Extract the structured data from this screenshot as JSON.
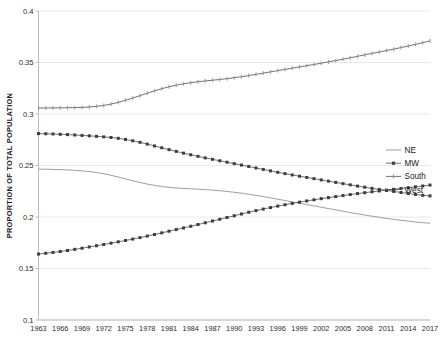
{
  "chart_data": {
    "type": "line",
    "title": "",
    "xlabel": "",
    "ylabel": "PROPORTION OF TOTAL POPULATION",
    "ylim": [
      0.1,
      0.4
    ],
    "yticks": [
      "0.1",
      "0.15",
      "0.2",
      "0.25",
      "0.3",
      "0.35",
      "0.4"
    ],
    "ytick_values": [
      0.1,
      0.15,
      0.2,
      0.25,
      0.3,
      0.35,
      0.4
    ],
    "grid": true,
    "legend_position": "right-middle",
    "xlim": [
      1963,
      2017
    ],
    "xtick_labels": [
      "1963",
      "1966",
      "1969",
      "1972",
      "1975",
      "1978",
      "1981",
      "1984",
      "1987",
      "1990",
      "1993",
      "1996",
      "1999",
      "2002",
      "2005",
      "2008",
      "2011",
      "2014",
      "2017"
    ],
    "x": [
      1963,
      1964,
      1965,
      1966,
      1967,
      1968,
      1969,
      1970,
      1971,
      1972,
      1973,
      1974,
      1975,
      1976,
      1977,
      1978,
      1979,
      1980,
      1981,
      1982,
      1983,
      1984,
      1985,
      1986,
      1987,
      1988,
      1989,
      1990,
      1991,
      1992,
      1993,
      1994,
      1995,
      1996,
      1997,
      1998,
      1999,
      2000,
      2001,
      2002,
      2003,
      2004,
      2005,
      2006,
      2007,
      2008,
      2009,
      2010,
      2011,
      2012,
      2013,
      2014,
      2015,
      2016,
      2017
    ],
    "series": [
      {
        "name": "NE",
        "marker": "none",
        "values": [
          0.2465,
          0.2464,
          0.2462,
          0.246,
          0.2457,
          0.2453,
          0.2448,
          0.2441,
          0.2432,
          0.242,
          0.2405,
          0.2388,
          0.237,
          0.2352,
          0.2335,
          0.232,
          0.2307,
          0.2296,
          0.2288,
          0.2282,
          0.2278,
          0.2274,
          0.227,
          0.2266,
          0.2261,
          0.2255,
          0.2248,
          0.224,
          0.2231,
          0.2221,
          0.221,
          0.2198,
          0.2186,
          0.2173,
          0.216,
          0.2147,
          0.2134,
          0.2121,
          0.2108,
          0.2095,
          0.2082,
          0.2069,
          0.2056,
          0.2043,
          0.2031,
          0.2019,
          0.2008,
          0.1997,
          0.1987,
          0.1977,
          0.1968,
          0.196,
          0.1952,
          0.1945,
          0.194
        ]
      },
      {
        "name": "MW",
        "marker": "square",
        "values": [
          0.281,
          0.2808,
          0.2806,
          0.2803,
          0.28,
          0.2796,
          0.2792,
          0.2788,
          0.2783,
          0.2778,
          0.2772,
          0.2764,
          0.2753,
          0.274,
          0.2725,
          0.2708,
          0.269,
          0.2672,
          0.2654,
          0.2637,
          0.262,
          0.2604,
          0.2589,
          0.2574,
          0.256,
          0.2546,
          0.2532,
          0.2518,
          0.2504,
          0.249,
          0.2476,
          0.2462,
          0.2448,
          0.2434,
          0.2421,
          0.2408,
          0.2396,
          0.2384,
          0.2372,
          0.236,
          0.2348,
          0.2336,
          0.2324,
          0.2312,
          0.23,
          0.2289,
          0.2278,
          0.2268,
          0.2258,
          0.2248,
          0.2238,
          0.2228,
          0.2219,
          0.2211,
          0.2205
        ]
      },
      {
        "name": "South",
        "marker": "tick",
        "values": [
          0.3058,
          0.3058,
          0.3059,
          0.306,
          0.3061,
          0.3062,
          0.3064,
          0.3068,
          0.3074,
          0.3083,
          0.3096,
          0.3113,
          0.3133,
          0.3155,
          0.3178,
          0.3202,
          0.3225,
          0.3246,
          0.3264,
          0.328,
          0.3293,
          0.3304,
          0.3313,
          0.3321,
          0.3328,
          0.3335,
          0.3343,
          0.3352,
          0.3362,
          0.3373,
          0.3385,
          0.3397,
          0.3409,
          0.3421,
          0.3433,
          0.3445,
          0.3457,
          0.3469,
          0.3481,
          0.3493,
          0.3506,
          0.3519,
          0.3532,
          0.3546,
          0.356,
          0.3574,
          0.3588,
          0.3602,
          0.3616,
          0.363,
          0.3645,
          0.366,
          0.3676,
          0.3692,
          0.371
        ]
      },
      {
        "name": "West",
        "marker": "square",
        "values": [
          0.164,
          0.1648,
          0.1656,
          0.1665,
          0.1675,
          0.1686,
          0.1697,
          0.1709,
          0.1721,
          0.1733,
          0.1746,
          0.1759,
          0.1772,
          0.1786,
          0.18,
          0.1815,
          0.183,
          0.1846,
          0.1862,
          0.1878,
          0.1894,
          0.191,
          0.1927,
          0.1944,
          0.1961,
          0.1978,
          0.1995,
          0.2012,
          0.2029,
          0.2046,
          0.2062,
          0.2077,
          0.2092,
          0.2106,
          0.2119,
          0.2132,
          0.2144,
          0.2156,
          0.2167,
          0.2178,
          0.2188,
          0.2198,
          0.2208,
          0.2218,
          0.2227,
          0.2236,
          0.2245,
          0.2253,
          0.2261,
          0.2269,
          0.2277,
          0.2285,
          0.2293,
          0.2301,
          0.231
        ]
      }
    ],
    "legend": [
      {
        "label": "NE",
        "marker": "none"
      },
      {
        "label": "MW",
        "marker": "square"
      },
      {
        "label": "South",
        "marker": "tick"
      },
      {
        "label": "West",
        "marker": "square"
      }
    ],
    "colors": {
      "line_dark": "#595959",
      "line_light": "#8c8c8c",
      "marker_dark": "#3d3d3d",
      "marker_light": "#9a9a9a",
      "grid": "#e2e2e2",
      "axis": "#b5b5b5",
      "text": "#1a1a1a"
    }
  }
}
